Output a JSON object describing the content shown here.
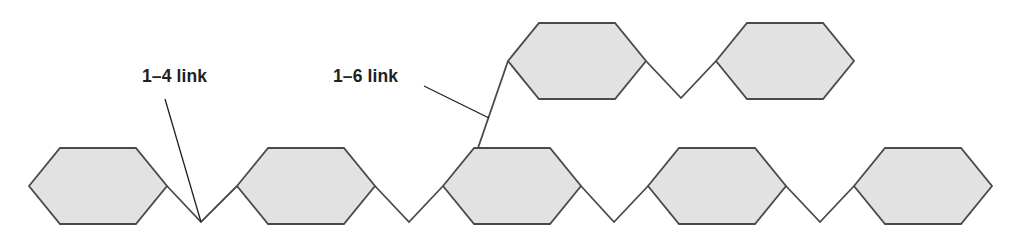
{
  "figure": {
    "name": "polysaccharide-branching-diagram",
    "width": 1031,
    "height": 242,
    "background_color": "#ffffff"
  },
  "style": {
    "ring_fill": "#e2e2e2",
    "ring_stroke": "#4a4a4a",
    "ring_stroke_width": 1.8,
    "bond_stroke": "#4a4a4a",
    "bond_stroke_width": 1.8,
    "leader_stroke": "#231f20",
    "leader_stroke_width": 1.3,
    "label_color": "#231f20",
    "label_font_size": 17.5
  },
  "labels": [
    {
      "id": "link-1-4",
      "text": "1–4 link",
      "x": 142,
      "y": 82,
      "leader": {
        "x1": 165,
        "y1": 99,
        "x2": 201,
        "y2": 222
      }
    },
    {
      "id": "link-1-6",
      "text": "1–6 link",
      "x": 333,
      "y": 82,
      "leader": {
        "x1": 424,
        "y1": 86,
        "x2": 489,
        "y2": 118
      }
    }
  ],
  "chart_data": {
    "type": "diagram",
    "rings": [
      {
        "id": "bottom-ring-1",
        "row": "bottom",
        "left": 29,
        "right": 167,
        "top": 148,
        "bottom": 224,
        "mid_y": 186
      },
      {
        "id": "bottom-ring-2",
        "row": "bottom",
        "left": 237,
        "right": 375,
        "top": 148,
        "bottom": 224,
        "mid_y": 186
      },
      {
        "id": "bottom-ring-3",
        "row": "bottom",
        "left": 443,
        "right": 581,
        "top": 148,
        "bottom": 224,
        "mid_y": 186
      },
      {
        "id": "bottom-ring-4",
        "row": "bottom",
        "left": 648,
        "right": 786,
        "top": 148,
        "bottom": 224,
        "mid_y": 186
      },
      {
        "id": "bottom-ring-5",
        "row": "bottom",
        "left": 854,
        "right": 992,
        "top": 148,
        "bottom": 224,
        "mid_y": 186
      },
      {
        "id": "top-ring-1",
        "row": "top",
        "left": 508,
        "right": 646,
        "top": 23,
        "bottom": 99,
        "mid_y": 61
      },
      {
        "id": "top-ring-2",
        "row": "top",
        "left": 716,
        "right": 854,
        "top": 23,
        "bottom": 99,
        "mid_y": 61
      }
    ],
    "bonds": [
      {
        "id": "bond-1-4-a",
        "type": "1-4",
        "points": "167,186 201,222 237,186"
      },
      {
        "id": "bond-1-4-b",
        "type": "1-4",
        "points": "375,186 409,222 443,186"
      },
      {
        "id": "bond-1-4-c",
        "type": "1-4",
        "points": "581,186 614,222 648,186"
      },
      {
        "id": "bond-1-4-d",
        "type": "1-4",
        "points": "786,186 820,222 854,186"
      },
      {
        "id": "bond-1-6",
        "type": "1-6",
        "points": "478,148 508,61"
      },
      {
        "id": "bond-1-4-top",
        "type": "1-4",
        "points": "646,61 681,98 716,61"
      }
    ],
    "notes": [
      "Five rings form the linear backbone along the bottom row.",
      "Two rings form the branch along the top row.",
      "A 1–6 link rises from the top-left corner of the third bottom ring to the left vertex of the first top ring."
    ]
  }
}
